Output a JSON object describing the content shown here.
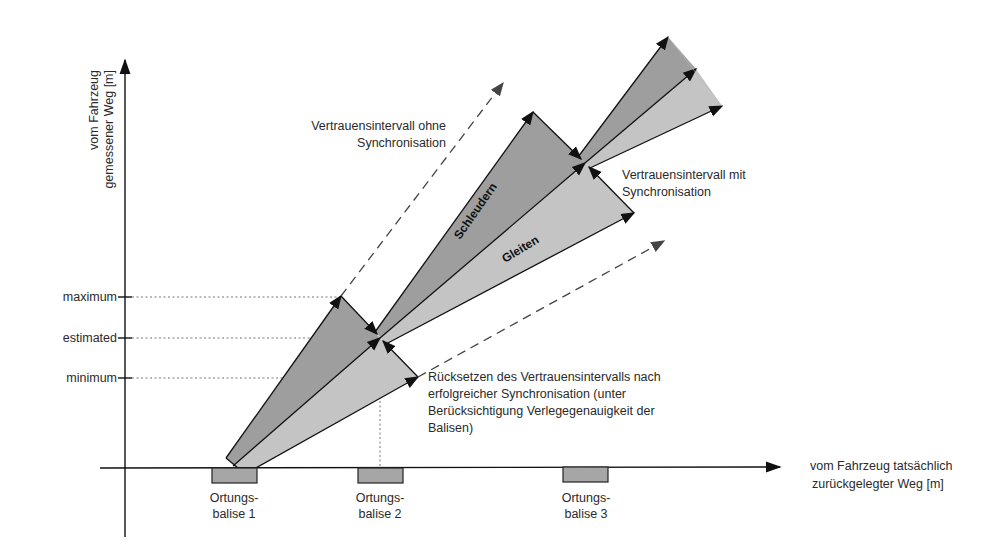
{
  "axes": {
    "y_label_line1": "vom Fahrzeug",
    "y_label_line2": "gemessener Weg [m]",
    "x_label_line1": "vom Fahrzeug tatsächlich",
    "x_label_line2": "zurückgelegter Weg [m]"
  },
  "ticks": {
    "maximum": "maximum",
    "estimated": "estimated",
    "minimum": "minimum"
  },
  "balises": [
    {
      "line1": "Ortungs-",
      "line2": "balise 1"
    },
    {
      "line1": "Ortungs-",
      "line2": "balise 2"
    },
    {
      "line1": "Ortungs-",
      "line2": "balise 3"
    }
  ],
  "annotations": {
    "without_sync_line1": "Vertrauensintervall ohne",
    "without_sync_line2": "Synchronisation",
    "with_sync_line1": "Vertrauensintervall mit",
    "with_sync_line2": "Synchronisation",
    "reset_line1": "Rücksetzen des Vertrauensintervalls nach",
    "reset_line2": "erfolgreicher Synchronisation (unter",
    "reset_line3": "Berücksichtigung Verlegegenauigkeit der",
    "reset_line4": "Balisen)",
    "slip": "Schleudern",
    "slide": "Gleiten"
  },
  "colors": {
    "upper_band": "#9e9e9e",
    "lower_band": "#c4c4c4",
    "balise_fill": "#a6a6a6",
    "line": "#111111",
    "dotted": "#777777"
  }
}
